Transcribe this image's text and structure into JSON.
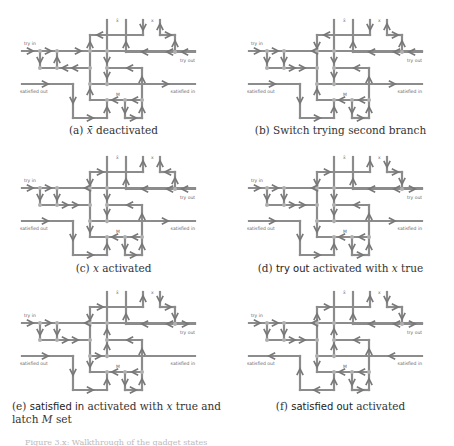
{
  "figure": {
    "line_color": "#8c8c8c",
    "node_color": "#b0b0b0",
    "arrow_color": "#777777",
    "label_color": "#666666",
    "labels": {
      "try_in": "try in",
      "try_out": "try out",
      "satisfied_out": "satisfied out",
      "satisfied_in": "satisfied in",
      "xbar": "x̄",
      "x": "x",
      "M": "M"
    },
    "panels": [
      {
        "id": "a",
        "prefix": "(a)",
        "caption_parts": [
          {
            "t": "x̄",
            "style": "italic"
          },
          {
            "t": " deactivated",
            "style": "serif"
          }
        ],
        "caption_text": "(a) x̄ deactivated"
      },
      {
        "id": "b",
        "prefix": "(b)",
        "caption_parts": [
          {
            "t": "Switch trying second branch",
            "style": "serif"
          }
        ],
        "caption_text": "(b) Switch trying second branch"
      },
      {
        "id": "c",
        "prefix": "(c)",
        "caption_parts": [
          {
            "t": "x",
            "style": "italic"
          },
          {
            "t": " activated",
            "style": "serif"
          }
        ],
        "caption_text": "(c) x activated"
      },
      {
        "id": "d",
        "prefix": "(d)",
        "caption_parts": [
          {
            "t": "try out",
            "style": "sans"
          },
          {
            "t": " activated with ",
            "style": "serif"
          },
          {
            "t": "x",
            "style": "italic"
          },
          {
            "t": " true",
            "style": "serif"
          }
        ],
        "caption_text": "(d) try out activated with x true"
      },
      {
        "id": "e",
        "prefix": "(e)",
        "caption_parts": [
          {
            "t": "satisfied in",
            "style": "sans"
          },
          {
            "t": " activated with ",
            "style": "serif"
          },
          {
            "t": "x",
            "style": "italic"
          },
          {
            "t": " true and",
            "style": "serif"
          }
        ],
        "caption_line2_parts": [
          {
            "t": "latch ",
            "style": "serif"
          },
          {
            "t": "M",
            "style": "italic"
          },
          {
            "t": " set",
            "style": "serif"
          }
        ],
        "caption_text": "(e) satisfied in activated with x true and latch M set"
      },
      {
        "id": "f",
        "prefix": "(f)",
        "caption_parts": [
          {
            "t": "satisfied out",
            "style": "sans"
          },
          {
            "t": " activated",
            "style": "serif"
          }
        ],
        "caption_text": "(f) satisfied out activated"
      }
    ]
  },
  "footer_text": "Figure 3.x: Walkthrough of the gadget states"
}
